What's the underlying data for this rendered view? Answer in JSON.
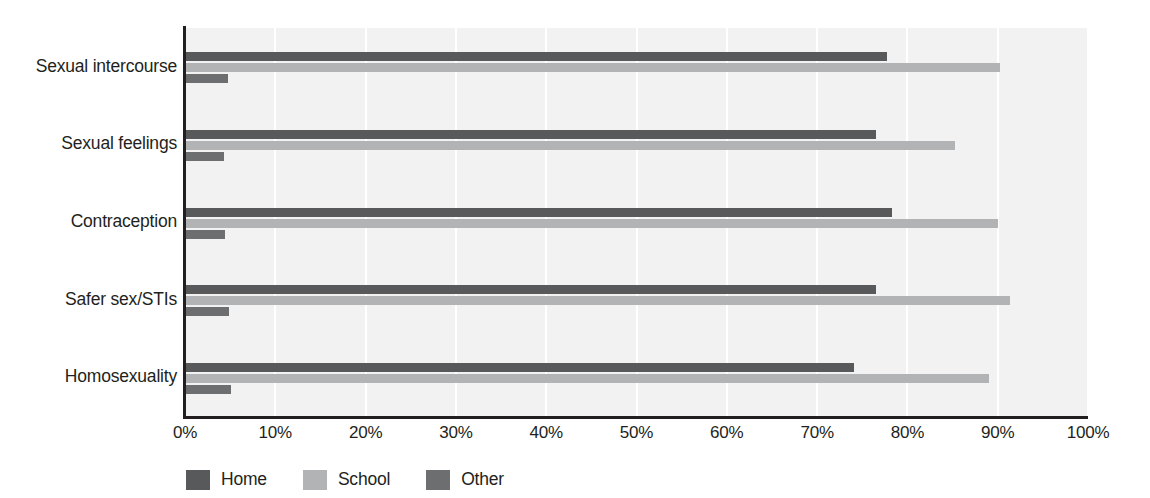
{
  "chart_data": {
    "type": "bar",
    "orientation": "horizontal",
    "title": "",
    "xlabel": "",
    "ylabel": "",
    "xlim": [
      0,
      100
    ],
    "xticks": [
      "0%",
      "10%",
      "20%",
      "30%",
      "40%",
      "50%",
      "60%",
      "70%",
      "80%",
      "90%",
      "100%"
    ],
    "xtick_values": [
      0,
      10,
      20,
      30,
      40,
      50,
      60,
      70,
      80,
      90,
      100
    ],
    "grid": "vertical",
    "legend_position": "bottom-left",
    "categories": [
      "Sexual intercourse",
      "Sexual feelings",
      "Contraception",
      "Safer sex/STIs",
      "Homosexuality"
    ],
    "series": [
      {
        "name": "Home",
        "color": "#58595b",
        "values": [
          77.7,
          76.5,
          78.3,
          76.5,
          74.1
        ]
      },
      {
        "name": "School",
        "color": "#b1b3b5",
        "values": [
          90.2,
          85.3,
          90.0,
          91.4,
          89.0
        ]
      },
      {
        "name": "Other",
        "color": "#6d6e70",
        "values": [
          4.8,
          4.3,
          4.4,
          4.9,
          5.1
        ]
      }
    ]
  },
  "colors": {
    "plot_background": "#f2f2f2",
    "page_background": "#ffffff",
    "axis": "#231f20",
    "gridline": "#ffffff",
    "home": "#58595b",
    "school": "#b1b3b5",
    "other": "#6d6e70"
  }
}
